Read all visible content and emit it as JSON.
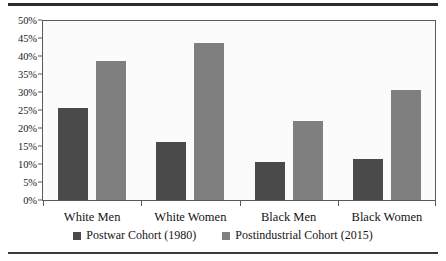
{
  "chart_data": {
    "type": "bar",
    "title": "",
    "xlabel": "",
    "ylabel": "",
    "categories": [
      "White Men",
      "White Women",
      "Black Men",
      "Black Women"
    ],
    "series": [
      {
        "name": "Postwar Cohort (1980)",
        "color": "#4a4a4a",
        "values": [
          25.5,
          16.0,
          10.5,
          11.5
        ]
      },
      {
        "name": "Postindustrial Cohort (2015)",
        "color": "#7f7f7f",
        "values": [
          38.5,
          43.5,
          22.0,
          30.5
        ]
      }
    ],
    "ylim": [
      0,
      50
    ],
    "ytick_step": 5,
    "ytick_labels": [
      "0%",
      "5%",
      "10%",
      "15%",
      "20%",
      "25%",
      "30%",
      "35%",
      "40%",
      "45%",
      "50%"
    ],
    "grid": false,
    "legend_position": "bottom"
  },
  "figure": {
    "rule_top_name": "top-rule",
    "rule_bottom_name": "bottom-rule"
  }
}
